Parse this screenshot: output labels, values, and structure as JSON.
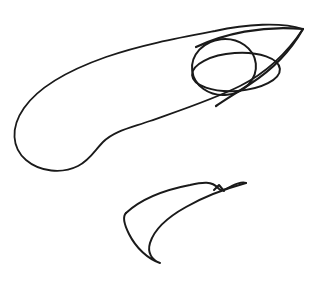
{
  "canvas": {
    "width": 317,
    "height": 284,
    "background_color": "#ffffff",
    "ink_color": "#1a1a1a",
    "title": "Hand-drawn line sketch of a fish-like creature"
  },
  "drawing": {
    "style": "freehand ink contour line drawing, no fill, no shading, no text labels",
    "subject": "stylized fish / dolphin-like creature seen in profile facing right, plus a detached curved fin below",
    "stroke_width": 1.8,
    "stroke_width_thick": 2.2,
    "strokes": [
      {
        "name": "body-outline",
        "description": "Large closed-ish sweeping contour forming the back, belly and flank of the creature, running from the pointed snout at upper right, arcing left across the top, curving down the far left side, looping under at the lower left, then rising back to the right toward the head",
        "path": "M 303 29 C 281 22, 246 24, 215 31 C 178 38, 140 45, 106 57 C 72 69, 40 85, 24 108 C 10 128, 12 148, 26 160 C 40 172, 62 174, 78 166 C 90 160, 95 150, 103 142 C 114 131, 130 128, 150 121 C 178 111, 212 100, 240 86 C 262 75, 283 59, 303 29 Z",
        "closed": true
      },
      {
        "name": "eye-circle",
        "description": "Near-circular eye outline on the head, overlapping the snout and body lines",
        "center": [
          224,
          67
        ],
        "radius_x": 32,
        "radius_y": 28,
        "rotation_deg": -6
      },
      {
        "name": "gill-ellipse",
        "description": "Wide flattened ellipse crossing the head region, reading as the open mouth / gill opening, extending right past the eye toward the jaw",
        "center": [
          236,
          72
        ],
        "radius_x": 44,
        "radius_y": 19,
        "rotation_deg": -4
      },
      {
        "name": "snout-upper-edge",
        "description": "Upper edge of the pointed snout leading to the sharp tip at the far upper right",
        "path": "M 196 47 C 224 34, 262 25, 303 29"
      },
      {
        "name": "snout-lower-edge",
        "description": "Lower edge of the snout descending from the sharp tip back left toward the jaw and under the eye",
        "path": "M 303 29 C 291 50, 272 70, 250 84 C 238 92, 226 99, 216 106"
      },
      {
        "name": "fin-upper-edge",
        "description": "Upper sweeping edge of the detached fin below the body, rising from lower left up to the right with a small V notch near its right end",
        "path": "M 126 213 C 140 200, 164 190, 190 185 C 203 182, 212 181, 218 188 C 221 192, 224 190, 232 186 C 238 183, 243 182, 246 183"
      },
      {
        "name": "fin-lower-edge",
        "description": "Lower curved edge of the fin sweeping down from the right back to a sharp point at the bottom, then curving up the left side to rejoin the upper edge",
        "path": "M 246 183 C 228 188, 205 196, 186 207 C 168 217, 154 230, 150 243 C 147 253, 152 260, 160 263 C 148 259, 136 248, 129 234 C 123 222, 123 216, 126 213"
      },
      {
        "name": "fin-notch",
        "description": "Small angular notch detail on the upper right of the fin",
        "path": "M 214 190 L 219 185 L 224 191"
      }
    ],
    "key_points": {
      "snout_tip": [
        304,
        28
      ],
      "body_top_peak": [
        176,
        33
      ],
      "body_left_extreme": [
        14,
        118
      ],
      "body_bottom_loop": [
        52,
        170
      ],
      "eye_center": [
        224,
        67
      ],
      "fin_bottom_point": [
        160,
        263
      ],
      "fin_right_tip": [
        246,
        183
      ],
      "fin_left_tip": [
        125,
        214
      ]
    }
  }
}
